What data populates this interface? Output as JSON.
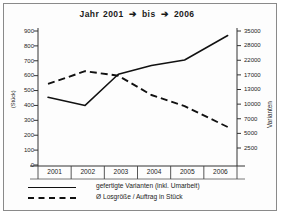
{
  "title": {
    "prefix": "Jahr",
    "from": "2001",
    "mid": "bis",
    "to": "2006",
    "arrow": "➔",
    "full": "Jahr 2001 ➔ bis ➔ 2006"
  },
  "axis_left_label": "(Stück)",
  "axis_right_label": "Varianten",
  "legend": [
    {
      "label": "gefertigte Varianten (inkl. Umarbeit)",
      "style": "solid"
    },
    {
      "label": "Ø Losgröße / Auftrag in Stück",
      "style": "dashed"
    }
  ],
  "colors": {
    "line": "#111111",
    "axis": "#333333",
    "frame": "#8a8a8a",
    "text": "#1c1c1c"
  },
  "chart_data": {
    "type": "line",
    "xlabel": "",
    "ylabel": "(Stück)",
    "y2label": "Varianten",
    "grid": false,
    "legend_position": "bottom",
    "categories": [
      "2001",
      "2002",
      "2003",
      "2004",
      "2005",
      "2006"
    ],
    "left_axis": {
      "ticks": [
        0,
        100,
        200,
        300,
        400,
        500,
        600,
        700,
        800,
        900
      ],
      "ylim": [
        0,
        900
      ]
    },
    "right_axis": {
      "ticks": [
        2500,
        5000,
        7000,
        10000,
        13000,
        17000,
        22000,
        28000,
        35000
      ],
      "note": "non-linear spacing"
    },
    "series": [
      {
        "name": "gefertigte Varianten (inkl. Umarbeit)",
        "style": "solid",
        "axis": "right",
        "values_left_scale": [
          455,
          400,
          610,
          668,
          705,
          870
        ],
        "values": [
          10400,
          9100,
          16900,
          19200,
          21000,
          31500
        ]
      },
      {
        "name": "Ø Losgröße / Auftrag in Stück",
        "style": "dashed",
        "axis": "right",
        "values_left_scale": [
          545,
          630,
          600,
          470,
          395,
          255
        ],
        "values": [
          13800,
          17200,
          16500,
          11600,
          9300,
          5500
        ]
      }
    ]
  }
}
